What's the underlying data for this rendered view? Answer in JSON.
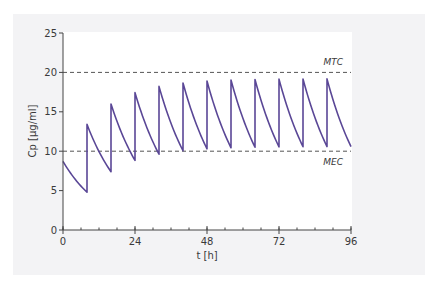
{
  "chart_data": {
    "type": "line",
    "title": "",
    "xlabel": "t [h]",
    "ylabel": "Cp [µg/ml]",
    "xlim": [
      0,
      96
    ],
    "ylim": [
      0,
      25
    ],
    "x_ticks": [
      0,
      24,
      48,
      72,
      96
    ],
    "x_minor_tick_step": 6,
    "y_ticks": [
      0,
      5,
      10,
      15,
      20,
      25
    ],
    "grid": false,
    "legend": null,
    "dosing_interval_h": 8,
    "series": [
      {
        "name": "Plasma concentration (multiple IV bolus dosing)",
        "color": "#5a4796",
        "initial_concentration": 8.7,
        "decay_factor_per_interval": 0.552,
        "dose_increment": 8.6,
        "peaks": [
          {
            "t": 0,
            "value": 8.7
          },
          {
            "t": 8,
            "value": 13.4
          },
          {
            "t": 16,
            "value": 16.0
          },
          {
            "t": 24,
            "value": 17.4
          },
          {
            "t": 32,
            "value": 18.2
          },
          {
            "t": 40,
            "value": 18.7
          },
          {
            "t": 48,
            "value": 18.9
          },
          {
            "t": 56,
            "value": 19.0
          },
          {
            "t": 64,
            "value": 19.1
          },
          {
            "t": 72,
            "value": 19.2
          },
          {
            "t": 80,
            "value": 19.2
          },
          {
            "t": 88,
            "value": 19.2
          }
        ],
        "troughs": [
          {
            "t": 8,
            "value": 4.8
          },
          {
            "t": 16,
            "value": 7.4
          },
          {
            "t": 24,
            "value": 8.8
          },
          {
            "t": 32,
            "value": 9.6
          },
          {
            "t": 40,
            "value": 10.1
          },
          {
            "t": 48,
            "value": 10.3
          },
          {
            "t": 56,
            "value": 10.5
          },
          {
            "t": 64,
            "value": 10.5
          },
          {
            "t": 72,
            "value": 10.6
          },
          {
            "t": 80,
            "value": 10.6
          },
          {
            "t": 88,
            "value": 10.6
          },
          {
            "t": 96,
            "value": 10.6
          }
        ]
      }
    ],
    "reference_lines": [
      {
        "label": "MTC",
        "value": 20,
        "style": "dashed"
      },
      {
        "label": "MEC",
        "value": 10,
        "style": "dashed"
      }
    ]
  }
}
